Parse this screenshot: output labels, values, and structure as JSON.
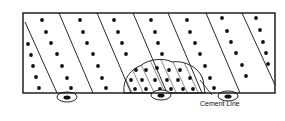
{
  "diagram": {
    "labels": {
      "cement_line": "Cement Line"
    },
    "box": {
      "x": 23,
      "y": 13,
      "w": 252,
      "h": 80
    },
    "lines": [
      [
        [
          25,
          22
        ],
        [
          57,
          93
        ]
      ],
      [
        [
          59,
          13
        ],
        [
          93,
          93
        ]
      ],
      [
        [
          97,
          13
        ],
        [
          131,
          93
        ]
      ],
      [
        [
          133,
          13
        ],
        [
          167,
          93
        ]
      ],
      [
        [
          168,
          13
        ],
        [
          202,
          93
        ]
      ],
      [
        [
          206,
          13
        ],
        [
          240,
          93
        ]
      ],
      [
        [
          242,
          13
        ],
        [
          275,
          85
        ]
      ]
    ],
    "dots": [
      [
        42,
        20
      ],
      [
        46,
        32
      ],
      [
        51,
        43
      ],
      [
        57,
        54
      ],
      [
        62,
        66
      ],
      [
        67,
        78
      ],
      [
        71,
        88
      ],
      [
        28,
        44
      ],
      [
        31,
        55
      ],
      [
        33,
        66
      ],
      [
        36,
        77
      ],
      [
        39,
        88
      ],
      [
        80,
        20
      ],
      [
        83,
        32
      ],
      [
        87,
        43
      ],
      [
        93,
        54
      ],
      [
        98,
        66
      ],
      [
        102,
        78
      ],
      [
        106,
        88
      ],
      [
        114,
        20
      ],
      [
        118,
        32
      ],
      [
        122,
        43
      ],
      [
        126,
        54
      ],
      [
        151,
        20
      ],
      [
        155,
        32
      ],
      [
        158,
        43
      ],
      [
        162,
        54
      ],
      [
        187,
        20
      ],
      [
        190,
        32
      ],
      [
        195,
        43
      ],
      [
        200,
        54
      ],
      [
        205,
        66
      ],
      [
        210,
        78
      ],
      [
        214,
        88
      ],
      [
        222,
        18
      ],
      [
        227,
        31
      ],
      [
        231,
        42
      ],
      [
        236,
        53
      ],
      [
        242,
        65
      ],
      [
        246,
        76
      ],
      [
        256,
        18
      ],
      [
        260,
        30
      ],
      [
        263,
        42
      ],
      [
        266,
        53
      ],
      [
        268,
        64
      ],
      [
        136,
        70
      ],
      [
        131,
        80
      ],
      [
        135,
        89
      ],
      [
        146,
        70
      ],
      [
        142,
        80
      ],
      [
        146,
        89
      ],
      [
        157,
        68
      ],
      [
        155,
        80
      ],
      [
        160,
        89
      ],
      [
        169,
        70
      ],
      [
        167,
        80
      ],
      [
        171,
        89
      ],
      [
        180,
        70
      ],
      [
        178,
        80
      ],
      [
        183,
        89
      ],
      [
        190,
        78
      ],
      [
        193,
        89
      ]
    ],
    "hatch_region": "M124,93 C122,78 133,68 140,66 C150,58 165,58 172,62 C185,60 200,68 203,80 L205,93 Z",
    "cement_lines": [
      {
        "cx": 67,
        "cy": 97,
        "rx": 10,
        "ry": 5
      },
      {
        "cx": 161,
        "cy": 95,
        "rx": 10,
        "ry": 5
      },
      {
        "cx": 228,
        "cy": 96,
        "rx": 10,
        "ry": 5
      }
    ]
  }
}
